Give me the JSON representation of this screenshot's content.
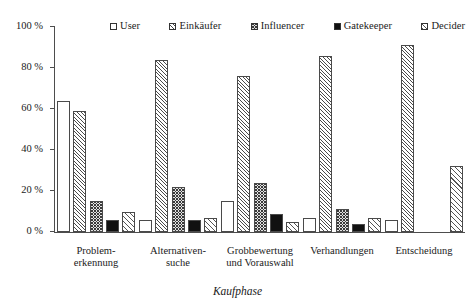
{
  "axis": {
    "x_title": "Kaufphase",
    "y_ticks": [
      "100 %",
      "80 %",
      "60 %",
      "40 %",
      "20 %",
      "0 %"
    ]
  },
  "legend": {
    "items": [
      {
        "label": "User",
        "pattern": "plain",
        "icon": "legend-swatch-empty-square"
      },
      {
        "label": "Einkäufer",
        "pattern": "diag",
        "icon": "legend-swatch-diagonal-hatch"
      },
      {
        "label": "Influencer",
        "pattern": "cross",
        "icon": "legend-swatch-crosshatch"
      },
      {
        "label": "Gatekeeper",
        "pattern": "solid",
        "icon": "legend-swatch-solid-black"
      },
      {
        "label": "Decider",
        "pattern": "diag-wide",
        "icon": "legend-swatch-wide-diagonal-hatch"
      }
    ]
  },
  "categories_display": [
    "Problem-\nerkennung",
    "Alternativen-\nsuche",
    "Grobbewertung\nund Vorauswahl",
    "Verhandlungen",
    "Entscheidung"
  ],
  "chart_data": {
    "type": "bar",
    "title": "",
    "subtitle": "",
    "xlabel": "Kaufphase",
    "ylabel": "",
    "ylim": [
      0,
      100
    ],
    "yunit": "%",
    "ytick_values": [
      0,
      20,
      40,
      60,
      80,
      100
    ],
    "ytick_labels": [
      "0 %",
      "20 %",
      "40 %",
      "60 %",
      "80 %",
      "100 %"
    ],
    "grid": false,
    "legend_position": "top",
    "categories": [
      "Problemerkennung",
      "Alternativensuche",
      "Grobbewertung und Vorauswahl",
      "Verhandlungen",
      "Entscheidung"
    ],
    "series": [
      {
        "name": "User",
        "values": [
          64,
          6,
          15,
          7,
          6
        ]
      },
      {
        "name": "Einkäufer",
        "values": [
          59,
          84,
          76,
          86,
          91
        ]
      },
      {
        "name": "Influencer",
        "values": [
          15,
          22,
          24,
          11,
          0
        ]
      },
      {
        "name": "Gatekeeper",
        "values": [
          6,
          6,
          9,
          4,
          0
        ]
      },
      {
        "name": "Decider",
        "values": [
          10,
          7,
          5,
          7,
          32
        ]
      }
    ]
  },
  "colors": {
    "axis": "#4d4d4d",
    "bar_outline": "#4a4a4a",
    "solid_fill": "#111111",
    "text": "#1a1a1a",
    "background": "#ffffff"
  }
}
